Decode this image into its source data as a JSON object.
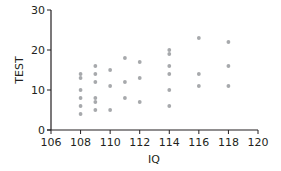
{
  "chart_data": {
    "type": "scatter",
    "title": "",
    "xlabel": "IQ",
    "ylabel": "TEST",
    "xlim": [
      106,
      120
    ],
    "ylim": [
      0,
      30
    ],
    "x_ticks": [
      106,
      108,
      110,
      112,
      114,
      116,
      118,
      120
    ],
    "y_ticks": [
      0,
      10,
      20,
      30
    ],
    "grid": false,
    "legend": null,
    "point_color": "#a7a9ac",
    "axis_color": "#231f20",
    "series": [
      {
        "name": "IQ vs TEST",
        "points": [
          {
            "x": 108,
            "y": 14
          },
          {
            "x": 108,
            "y": 13
          },
          {
            "x": 108,
            "y": 10
          },
          {
            "x": 108,
            "y": 8
          },
          {
            "x": 108,
            "y": 6
          },
          {
            "x": 108,
            "y": 4
          },
          {
            "x": 109,
            "y": 16
          },
          {
            "x": 109,
            "y": 14
          },
          {
            "x": 109,
            "y": 12
          },
          {
            "x": 109,
            "y": 8
          },
          {
            "x": 109,
            "y": 7
          },
          {
            "x": 109,
            "y": 5
          },
          {
            "x": 110,
            "y": 15
          },
          {
            "x": 110,
            "y": 11
          },
          {
            "x": 110,
            "y": 5
          },
          {
            "x": 111,
            "y": 18
          },
          {
            "x": 111,
            "y": 12
          },
          {
            "x": 111,
            "y": 8
          },
          {
            "x": 112,
            "y": 17
          },
          {
            "x": 112,
            "y": 13
          },
          {
            "x": 112,
            "y": 7
          },
          {
            "x": 114,
            "y": 20
          },
          {
            "x": 114,
            "y": 19
          },
          {
            "x": 114,
            "y": 16
          },
          {
            "x": 114,
            "y": 14
          },
          {
            "x": 114,
            "y": 10
          },
          {
            "x": 114,
            "y": 6
          },
          {
            "x": 116,
            "y": 23
          },
          {
            "x": 116,
            "y": 14
          },
          {
            "x": 116,
            "y": 11
          },
          {
            "x": 118,
            "y": 22
          },
          {
            "x": 118,
            "y": 16
          },
          {
            "x": 118,
            "y": 11
          }
        ]
      }
    ]
  }
}
